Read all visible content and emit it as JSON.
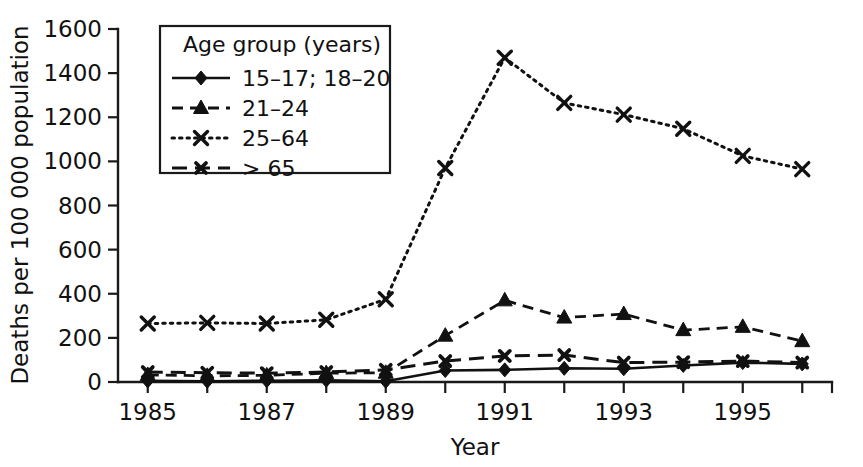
{
  "chart_data": {
    "type": "line",
    "title": "",
    "xlabel": "Year",
    "ylabel": "Deaths per 100 000 population",
    "x": [
      1985,
      1986,
      1987,
      1988,
      1989,
      1990,
      1991,
      1992,
      1993,
      1994,
      1995,
      1996
    ],
    "xlim": [
      1984.5,
      1996.5
    ],
    "ylim": [
      0,
      1600
    ],
    "ytick_labels": [
      "0",
      "200",
      "400",
      "600",
      "800",
      "1000",
      "1200",
      "1400",
      "1600"
    ],
    "yticks": [
      0,
      200,
      400,
      600,
      800,
      1000,
      1200,
      1400,
      1600
    ],
    "xtick_labels": [
      "1985",
      "",
      "1987",
      "",
      "1989",
      "",
      "1991",
      "",
      "1993",
      "",
      "1995",
      ""
    ],
    "grid": false,
    "legend_position": "upper-left-inside",
    "legend_title": "Age group (years)",
    "series": [
      {
        "name": "15–17; 18–20",
        "marker": "diamond",
        "dash": "solid",
        "values": [
          5,
          3,
          6,
          8,
          3,
          52,
          55,
          62,
          60,
          75,
          88,
          82
        ]
      },
      {
        "name": "21–24",
        "marker": "triangle",
        "dash": "dashed",
        "values": [
          32,
          28,
          30,
          40,
          42,
          210,
          370,
          292,
          308,
          235,
          250,
          185
        ]
      },
      {
        "name": "25–64",
        "marker": "cross",
        "dash": "dotted",
        "values": [
          265,
          268,
          265,
          282,
          375,
          970,
          1470,
          1265,
          1212,
          1148,
          1025,
          965
        ]
      },
      {
        "name": "> 65",
        "marker": "cross-small",
        "dash": "long-dash",
        "values": [
          45,
          42,
          40,
          45,
          55,
          95,
          118,
          122,
          88,
          90,
          95,
          88
        ]
      }
    ]
  },
  "axes": {
    "x_title": "Year",
    "y_title": "Deaths per 100 000 population"
  },
  "legend": {
    "title": "Age group (years)",
    "entries": [
      {
        "label": "15–17; 18–20"
      },
      {
        "label": "21–24"
      },
      {
        "label": "25–64"
      },
      {
        "label": "> 65"
      }
    ]
  }
}
